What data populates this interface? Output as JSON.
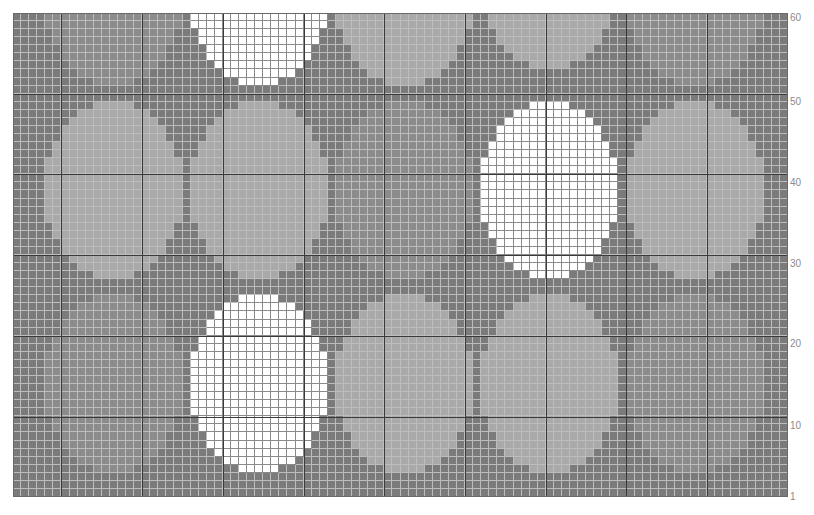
{
  "chart": {
    "cols": 96,
    "rows": 60,
    "cell_px": 8.07,
    "major_every": 10,
    "major_col_offset": 6,
    "colors": {
      "background": "#7b7b7b",
      "mid": "#8c8c8c",
      "light": "#a9a9a9",
      "white": "#ffffff",
      "gridline": "#bdbdbd",
      "white_gridline": "#8a8a8a",
      "major_line": "#3a3a3a"
    },
    "row_labels": [
      {
        "text": "60",
        "y": 18
      },
      {
        "text": "50",
        "y": 102
      },
      {
        "text": "40",
        "y": 183
      },
      {
        "text": "30",
        "y": 264
      },
      {
        "text": "20",
        "y": 344
      },
      {
        "text": "10",
        "y": 426
      },
      {
        "text": "1",
        "y": 497
      }
    ],
    "ovals": [
      {
        "tone": "mid",
        "c0": 4,
        "c1": 20,
        "r0": -12,
        "r1": 8
      },
      {
        "tone": "white",
        "c0": 22,
        "c1": 38,
        "r0": -12,
        "r1": 8
      },
      {
        "tone": "light",
        "c0": 40,
        "c1": 56,
        "r0": -12,
        "r1": 8
      },
      {
        "tone": "light",
        "c0": 58,
        "c1": 74,
        "r0": -14,
        "r1": 6
      },
      {
        "tone": "mid",
        "c0": 76,
        "c1": 92,
        "r0": -12,
        "r1": 8
      },
      {
        "tone": "light",
        "c0": 4,
        "c1": 20,
        "r0": 11,
        "r1": 32
      },
      {
        "tone": "light",
        "c0": 22,
        "c1": 38,
        "r0": 11,
        "r1": 32
      },
      {
        "tone": "mid",
        "c0": 40,
        "c1": 56,
        "r0": 11,
        "r1": 32
      },
      {
        "tone": "white",
        "c0": 58,
        "c1": 74,
        "r0": 11,
        "r1": 32
      },
      {
        "tone": "light",
        "c0": 76,
        "c1": 92,
        "r0": 11,
        "r1": 32
      },
      {
        "tone": "mid",
        "c0": 4,
        "c1": 20,
        "r0": 35,
        "r1": 56
      },
      {
        "tone": "white",
        "c0": 22,
        "c1": 38,
        "r0": 35,
        "r1": 56
      },
      {
        "tone": "light",
        "c0": 40,
        "c1": 56,
        "r0": 35,
        "r1": 56
      },
      {
        "tone": "light",
        "c0": 58,
        "c1": 74,
        "r0": 35,
        "r1": 56
      },
      {
        "tone": "mid",
        "c0": 76,
        "c1": 92,
        "r0": 35,
        "r1": 56
      }
    ]
  }
}
